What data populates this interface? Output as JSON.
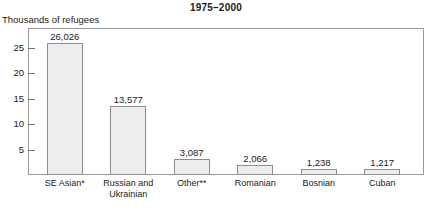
{
  "chart_data": {
    "type": "bar",
    "title": "1975–2000",
    "ylabel": "Thousands of refugees",
    "xlabel": "",
    "ylim": [
      0,
      29
    ],
    "grid": false,
    "legend": null,
    "ytick_labels": [
      "5",
      "10",
      "15",
      "20",
      "25"
    ],
    "ytick_values": [
      5,
      10,
      15,
      20,
      25
    ],
    "categories": [
      "SE Asian*",
      "Russian and Ukrainian",
      "Other**",
      "Romanian",
      "Bosnian",
      "Cuban"
    ],
    "category_lines": [
      [
        "SE Asian*"
      ],
      [
        "Russian and",
        "Ukrainian"
      ],
      [
        "Other**"
      ],
      [
        "Romanian"
      ],
      [
        "Bosnian"
      ],
      [
        "Cuban"
      ]
    ],
    "values": [
      26.026,
      13.577,
      3.087,
      2.066,
      1.238,
      1.217
    ],
    "value_labels": [
      "26,026",
      "13,577",
      "3,087",
      "2,066",
      "1,238",
      "1,217"
    ],
    "units_note": "values in thousands of refugees",
    "colors": {
      "bar_fill": "#ededed",
      "bar_border": "#8d8d8d",
      "frame": "#9a9a9a",
      "text": "#1a1a1a",
      "background": "#ffffff"
    }
  }
}
